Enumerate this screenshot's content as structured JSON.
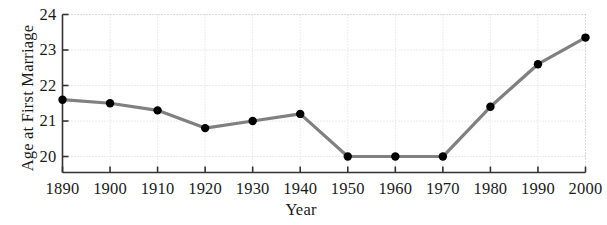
{
  "chart_data": {
    "type": "line",
    "title": "",
    "xlabel": "Year",
    "ylabel": "Age at First Marriage",
    "x": [
      1890,
      1900,
      1910,
      1920,
      1930,
      1940,
      1950,
      1960,
      1970,
      1980,
      1990,
      2000
    ],
    "values": [
      21.6,
      21.5,
      21.3,
      20.8,
      21.0,
      21.2,
      20.0,
      20.0,
      20.0,
      21.4,
      22.6,
      23.35
    ],
    "series": [
      {
        "name": "Age at First Marriage",
        "values": [
          21.6,
          21.5,
          21.3,
          20.8,
          21.0,
          21.2,
          20.0,
          20.0,
          20.0,
          21.4,
          22.6,
          23.35
        ]
      }
    ],
    "xlim": [
      1890,
      2000
    ],
    "ylim": [
      19.55,
      24.0
    ],
    "xticks": [
      1890,
      1900,
      1910,
      1920,
      1930,
      1940,
      1950,
      1960,
      1970,
      1980,
      1990,
      2000
    ],
    "xtick_labels": [
      "1890",
      "1900",
      "1910",
      "1920",
      "1930",
      "1940",
      "1950",
      "1960",
      "1970",
      "1980",
      "1990",
      "2000"
    ],
    "yticks": [
      20,
      21,
      22,
      23,
      24
    ],
    "ytick_labels": [
      "20",
      "21",
      "22",
      "23",
      "24"
    ],
    "grid": true,
    "legend": null,
    "legend_position": "none",
    "colors": {
      "line": "#808080",
      "marker": "#000000",
      "axis": "#333333",
      "grid": "#d8d8d8",
      "background": "#ffffff"
    },
    "marker": "filled-circle",
    "line_width_px": 3.2,
    "marker_radius_px": 4.2
  }
}
